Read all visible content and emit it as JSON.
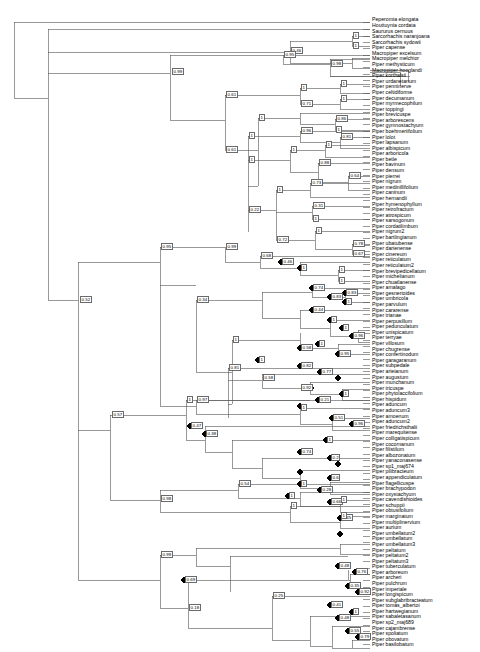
{
  "figure": {
    "type": "phylogenetic-tree",
    "layout": "rectangular-cladogram",
    "orientation": "left-to-right",
    "background_color": "#ffffff",
    "line_color": "#555555",
    "node_marker_color": "#000000",
    "label_box_border_color": "#6a6a6a",
    "support_label_description": "Bayesian posterior probability",
    "node_marker_description": "filled black circle marking node"
  },
  "chart_data": {
    "type": "tree",
    "title": "",
    "n_tips": 137,
    "tip_labels": [
      "Peperomia elongata",
      "Houttuynia cordata",
      "Saururus cernuus",
      "Sarcorhachis naranjoana",
      "Sarcorhachis sydowii",
      "Piper capense",
      "Macropiper excelsum",
      "Macropiper melchior",
      "Piper methysticum",
      "Macropiper hooglandi",
      "Piper korthalsii",
      "Piper urdanetanum",
      "Piper penninerve",
      "Piper celtidiforme",
      "Piper decumanum",
      "Piper myrmecophilum",
      "Piper toppingi",
      "Piper brevicuspe",
      "Piper arborescens",
      "Piper gymnostachyum",
      "Piper boehmeriifolium",
      "Piper lolot",
      "Piper lapsanum",
      "Piper albispicum",
      "Piper arboricola",
      "Piper betle",
      "Piper bavinum",
      "Piper densum",
      "Piper pierrei",
      "Piper nigrum",
      "Piper medinillifolium",
      "Piper caninum",
      "Piper hernandii",
      "Piper hymenophyllum",
      "Piper retrofractum",
      "Piper atrospicum",
      "Piper sarsogonum",
      "Piper cordatilimbum",
      "Piper nigrum2",
      "Piper bartlingianum",
      "Piper ubatubense",
      "Piper darienense",
      "Piper cinereum",
      "Piper reticulatum",
      "Piper reticulatum2",
      "Piper brevipedicellatum",
      "Piper michelianum",
      "Piper chuatlanense",
      "Piper amalago",
      "Piper gesnerioides",
      "Piper umbricola",
      "Piper parvulum",
      "Piper cararense",
      "Piper trianae",
      "Piper perpusillum",
      "Piper pedunculatum",
      "Piper unispicatum",
      "Piper terryae",
      "Piper villosum",
      "Piper chugrense",
      "Piper confertinodum",
      "Piper garagaranum",
      "Piper subpedale",
      "Piper arieianum",
      "Piper augustum",
      "Piper munchanum",
      "Piper tricuspe",
      "Piper phytolaccifolium",
      "Piper hispidum",
      "Piper aduncum",
      "Piper aduncum3",
      "Piper amoenum",
      "Piper aduncum2",
      "Piper friedrichsthalii",
      "Piper marequitense",
      "Piper colligatispicum",
      "Piper cocornanum",
      "Piper filistilum",
      "Piper albozonatum",
      "Piper yanaconasense",
      "Piper sp1_maj674",
      "Piper pilibracteum",
      "Piper appendiculatum",
      "Piper flagellicuspe",
      "Piper brachypodon",
      "Piper oxystachyum",
      "Piper cavendishioides",
      "Piper schuppii",
      "Piper obtusifolium",
      "Piper marginatum",
      "Piper multiplinervium",
      "Piper aurium",
      "Piper umbellatum2",
      "Piper umbellatum",
      "Piper umbellatum3",
      "Piper peltatum",
      "Piper peltatum2",
      "Piper peltatum3",
      "Piper tuberculatum",
      "Piper arboreum",
      "Piper archeri",
      "Piper pulchrum",
      "Piper imperiale",
      "Piper longispicum",
      "Piper subglabribracteatum",
      "Piper tomás_albertoi",
      "Piper hartwegianum",
      "Piper sabaletasanum",
      "Piper sp2_maj689",
      "Piper cajambrense",
      "Piper spoliatum",
      "Piper obovatum",
      "Piper basilobatum"
    ],
    "support_values": [
      "0.46",
      "1",
      "1",
      "0.99",
      "0.95",
      "0.98",
      "0.61",
      "1",
      "0.71",
      "1",
      "1",
      "0.61",
      "1",
      "0.86",
      "1",
      "1",
      "0.96",
      "0.81",
      "1",
      "1",
      "1",
      "0.88",
      "0.64",
      "1",
      "0.73",
      "0.31",
      "0.72",
      "1",
      "0.78",
      "0.22",
      "1",
      "0.67",
      "0.95",
      "0.99",
      "0.46",
      "1",
      "1",
      "1",
      "0.68",
      "0.74",
      "0.83",
      "0.83",
      "1",
      "0.34",
      "0.44",
      "1",
      "1",
      "0.96",
      "1",
      "1",
      "0.58",
      "0.95",
      "1",
      "0.82",
      "0.77",
      "0.97",
      "1",
      "0.51",
      "0.96",
      "0.47",
      "0.38",
      "1",
      "0.81",
      "0.92",
      "1",
      "0.21",
      "0.2",
      "0.58",
      "0.74",
      "0.6",
      "1",
      "0.28",
      "1",
      "0.66",
      "0.45",
      "0.52",
      "1",
      "0.54",
      "1",
      "1",
      "1",
      "0.98",
      "0.57",
      "0.99",
      "0.48",
      "0.76",
      "0.69",
      "0.35",
      "0.92",
      "0.18",
      "0.41",
      "1",
      "0.25",
      "0.48",
      "0.55",
      "0.79"
    ]
  }
}
